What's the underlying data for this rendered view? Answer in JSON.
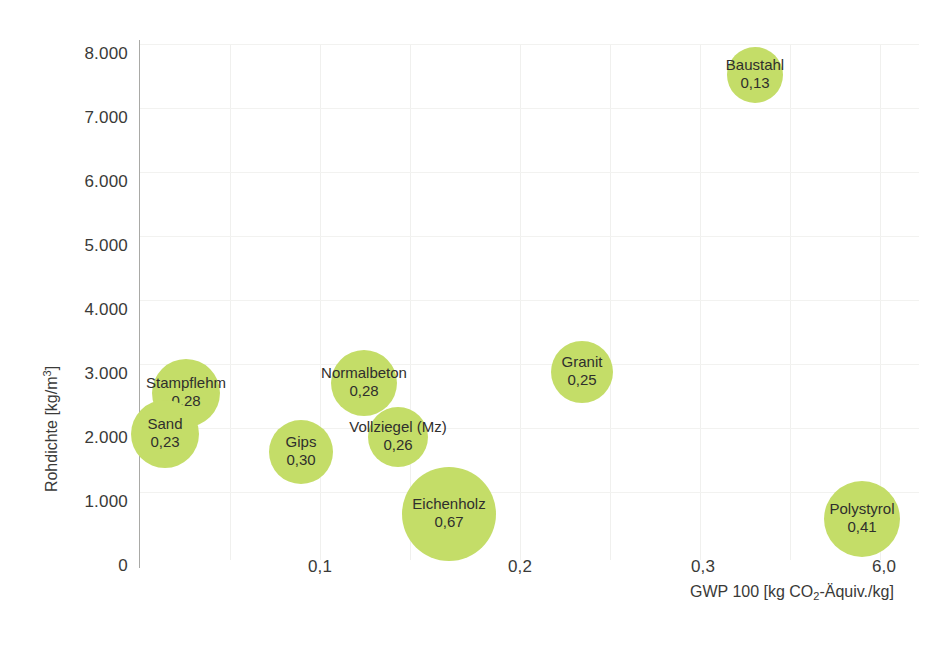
{
  "chart_data": {
    "type": "scatter",
    "variant": "bubble",
    "title": "",
    "xlabel": "GWP 100 [kg CO2-Äquiv./kg]",
    "xlabel_parts": {
      "pre": "GWP 100 [kg CO",
      "sub": "2",
      "post": "-Äquiv./kg]"
    },
    "ylabel": "Rohdichte [kg/m3]",
    "ylabel_parts": {
      "pre": "Rohdichte [kg/m",
      "sup": "3",
      "post": "]"
    },
    "grid": true,
    "legend": "none",
    "yticks": [
      "8.000",
      "7.000",
      "6.000",
      "5.000",
      "4.000",
      "3.000",
      "2.000",
      "1.000",
      "0"
    ],
    "ytick_values": [
      8000,
      7000,
      6000,
      5000,
      4000,
      3000,
      2000,
      1000,
      0
    ],
    "ylim": [
      0,
      8000
    ],
    "xticks": [
      "0,1",
      "0,2",
      "0,3",
      "6,0"
    ],
    "xtick_values": [
      0.1,
      0.2,
      0.3,
      6.0
    ],
    "x_axis_note": "broken axis: 0,3 followed by 6,0",
    "bubble_color": "#c4dd68",
    "points": [
      {
        "label": "Baustahl",
        "value": "0,13",
        "gwp": 0.13,
        "rohdichte": 7700,
        "size": 56
      },
      {
        "label": "Granit",
        "value": "0,25",
        "gwp": 0.25,
        "rohdichte": 2700,
        "size": 62
      },
      {
        "label": "Stampflehm",
        "value": "0,28",
        "gwp": 0.28,
        "rohdichte": 2200,
        "size": 68
      },
      {
        "label": "Normalbeton",
        "value": "0,28",
        "gwp": 0.28,
        "rohdichte": 2300,
        "size": 66
      },
      {
        "label": "Sand",
        "value": "0,23",
        "gwp": 0.23,
        "rohdichte": 1800,
        "size": 68
      },
      {
        "label": "Vollziegel (Mz)",
        "value": "0,26",
        "gwp": 0.26,
        "rohdichte": 1750,
        "size": 60
      },
      {
        "label": "Gips",
        "value": "0,30",
        "gwp": 0.3,
        "rohdichte": 1500,
        "size": 64
      },
      {
        "label": "Eichenholz",
        "value": "0,67",
        "gwp": 0.67,
        "rohdichte": 700,
        "size": 94
      },
      {
        "label": "Polystyrol",
        "value": "0,41",
        "gwp": 0.41,
        "rohdichte": 450,
        "size": 76
      }
    ]
  }
}
